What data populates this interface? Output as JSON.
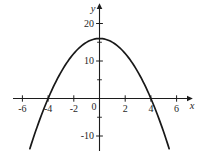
{
  "figure": {
    "title": "",
    "description_colors": {
      "background": "#ffffff",
      "axis": "#1c1c1c",
      "curve": "#181818",
      "text": "#1f1f1f"
    }
  },
  "chart_data": {
    "type": "line",
    "subtype": "function-curve",
    "title": "",
    "xlabel": "x",
    "ylabel": "y",
    "xlim": [
      -6.8,
      7.2
    ],
    "ylim": [
      -13.5,
      24
    ],
    "grid": false,
    "legend": null,
    "x_ticks": [
      -6,
      -4,
      -2,
      2,
      4,
      6
    ],
    "x_tick_labels": [
      "-6",
      "-4",
      "-2",
      "2",
      "4",
      "6"
    ],
    "y_ticks_major": [
      20,
      10,
      -10
    ],
    "y_tick_labels": [
      "20",
      "10",
      "-10"
    ],
    "y_ticks_minor": [
      15,
      5,
      -5
    ],
    "origin_label": "0",
    "function": {
      "expression": "y = 16 - x^2",
      "a": -1,
      "b": 0,
      "c": 16,
      "x_domain_drawn": [
        -5.42,
        5.42
      ]
    },
    "key_points": {
      "vertex": [
        0,
        16
      ],
      "x_intercepts": [
        [
          -4,
          0
        ],
        [
          4,
          0
        ]
      ],
      "y_intercept": [
        0,
        16
      ]
    },
    "series": [
      {
        "name": "y = 16 - x^2",
        "x": [
          -5,
          -4,
          -3,
          -2,
          -1,
          0,
          1,
          2,
          3,
          4,
          5
        ],
        "y": [
          -9,
          0,
          7,
          12,
          15,
          16,
          15,
          12,
          7,
          0,
          -9
        ]
      }
    ],
    "colors": {
      "axis": "#1c1c1c",
      "curve": "#181818",
      "text": "#1f1f1f",
      "background": "#ffffff"
    }
  }
}
